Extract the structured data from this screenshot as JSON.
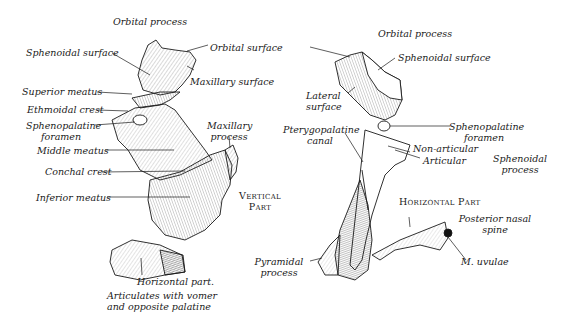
{
  "figure": {
    "left_view": {
      "labels": {
        "orbital_process": "Orbital process",
        "sphenoidal_surface": "Sphenoidal surface",
        "orbital_surface": "Orbital surface",
        "maxillary_surface": "Maxillary surface",
        "superior_meatus": "Superior meatus",
        "ethmoidal_crest": "Ethmoidal crest",
        "sphenopalatine_foramen_1": "Sphenopalatine",
        "sphenopalatine_foramen_2": "foramen",
        "maxillary_process_1": "Maxillary",
        "maxillary_process_2": "process",
        "middle_meatus": "Middle meatus",
        "conchal_crest": "Conchal crest",
        "inferior_meatus": "Inferior meatus",
        "horizontal_part": "Horizontal part.",
        "articulates_1": "Articulates with vomer",
        "articulates_2": "and opposite palatine"
      }
    },
    "center": {
      "vertical_part_1": "Vertical",
      "vertical_part_2": "Part"
    },
    "right_view": {
      "labels": {
        "orbital_process": "Orbital process",
        "sphenoidal_surface": "Sphenoidal surface",
        "lateral_surface_1": "Lateral",
        "lateral_surface_2": "surface",
        "pterygopalatine_canal_1": "Pterygopalatine",
        "pterygopalatine_canal_2": "canal",
        "sphenopalatine_foramen_1": "Sphenopalatine",
        "sphenopalatine_foramen_2": "foramen",
        "non_articular": "Non-articular",
        "articular": "Articular",
        "sphenoidal_process_1": "Sphenoidal",
        "sphenoidal_process_2": "process",
        "horizontal_part": "Horizontal Part",
        "posterior_nasal_spine_1": "Posterior nasal",
        "posterior_nasal_spine_2": "spine",
        "pyramidal_process_1": "Pyramidal",
        "pyramidal_process_2": "process",
        "m_uvulae": "M. uvulae"
      }
    },
    "colors": {
      "ink": "#1a1a1a",
      "hatch": "#555555",
      "background": "#ffffff"
    }
  }
}
